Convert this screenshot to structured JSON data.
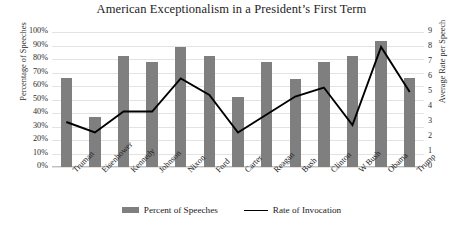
{
  "chart_data": {
    "type": "bar",
    "title": "American Exceptionalism in a President’s First Term",
    "xlabel": "",
    "ylabel": "Percentage of Speeches",
    "y2label": "Average Rate per Speech",
    "ylim": [
      0,
      100
    ],
    "y2lim": [
      0,
      9
    ],
    "grid": true,
    "legend_position": "bottom-center",
    "categories": [
      "Truman",
      "Eisenhower",
      "Kennedy",
      "Johnson",
      "Nixon",
      "Ford",
      "Carter",
      "Reagan",
      "Bush",
      "Clinton",
      "W Bush",
      "Obama",
      "Trump"
    ],
    "y_ticks": [
      "0%",
      "10%",
      "20%",
      "30%",
      "40%",
      "50%",
      "60%",
      "70%",
      "80%",
      "90%",
      "100%"
    ],
    "y2_ticks": [
      "0",
      "1",
      "2",
      "3",
      "4",
      "5",
      "6",
      "7",
      "8",
      "9"
    ],
    "series": [
      {
        "name": "Percent of Speeches",
        "type": "bar",
        "axis": "left",
        "color": "#7f7f7f",
        "values": [
          66,
          37,
          82,
          78,
          89,
          82,
          52,
          78,
          65,
          78,
          82,
          93,
          66
        ]
      },
      {
        "name": "Rate of Invocation",
        "type": "line",
        "axis": "right",
        "color": "#000000",
        "values": [
          3.0,
          2.3,
          3.7,
          3.7,
          5.9,
          4.8,
          2.3,
          3.5,
          4.7,
          5.3,
          2.8,
          8.0,
          5.0
        ]
      }
    ]
  },
  "legend": {
    "items": [
      {
        "label": "Percent of Speeches",
        "marker": "bar-swatch"
      },
      {
        "label": "Rate of Invocation",
        "marker": "line-swatch"
      }
    ]
  }
}
